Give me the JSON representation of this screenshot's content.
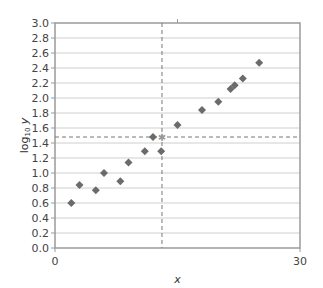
{
  "chart_data": {
    "type": "scatter",
    "title": "",
    "xlabel": "x",
    "ylabel": "log10 y",
    "ylabel_parts": {
      "main": "log",
      "sub": "10",
      "var": "y"
    },
    "xlim": [
      0,
      30
    ],
    "ylim": [
      0.0,
      3.0
    ],
    "x_ticks": [
      0,
      30
    ],
    "x_tick_labels": [
      "0",
      "30"
    ],
    "y_ticks": [
      0.0,
      0.2,
      0.4,
      0.6,
      0.8,
      1.0,
      1.2,
      1.4,
      1.6,
      1.8,
      2.0,
      2.2,
      2.4,
      2.6,
      2.8,
      3.0
    ],
    "y_tick_labels": [
      "0.0",
      "0.2",
      "0.4",
      "0.6",
      "0.8",
      "1.0",
      "1.2",
      "1.4",
      "1.6",
      "1.8",
      "2.0",
      "2.2",
      "2.4",
      "2.6",
      "2.8",
      "3.0"
    ],
    "grid": {
      "horizontal": true,
      "vertical": false
    },
    "legend": null,
    "marker": "diamond",
    "marker_color": "#6b6b6b",
    "series": [
      {
        "name": "data",
        "points": [
          {
            "x": 2.0,
            "y": 0.6
          },
          {
            "x": 3.0,
            "y": 0.84
          },
          {
            "x": 5.0,
            "y": 0.77
          },
          {
            "x": 6.0,
            "y": 1.0
          },
          {
            "x": 8.0,
            "y": 0.89
          },
          {
            "x": 9.0,
            "y": 1.14
          },
          {
            "x": 11.0,
            "y": 1.29
          },
          {
            "x": 12.0,
            "y": 1.48
          },
          {
            "x": 13.0,
            "y": 1.29
          },
          {
            "x": 15.0,
            "y": 1.64
          },
          {
            "x": 18.0,
            "y": 1.84
          },
          {
            "x": 20.0,
            "y": 1.95
          },
          {
            "x": 21.5,
            "y": 2.12
          },
          {
            "x": 22.0,
            "y": 2.17
          },
          {
            "x": 23.0,
            "y": 2.26
          },
          {
            "x": 25.0,
            "y": 2.47
          }
        ]
      }
    ],
    "annotations": [
      {
        "type": "crosshair",
        "x": 13.1,
        "y": 1.48,
        "style": "dashed",
        "marker": "star"
      }
    ]
  },
  "colors": {
    "axis": "#9a9a9a",
    "grid": "#cfcfcf",
    "marker": "#6b6b6b",
    "crosshair": "#777777"
  }
}
